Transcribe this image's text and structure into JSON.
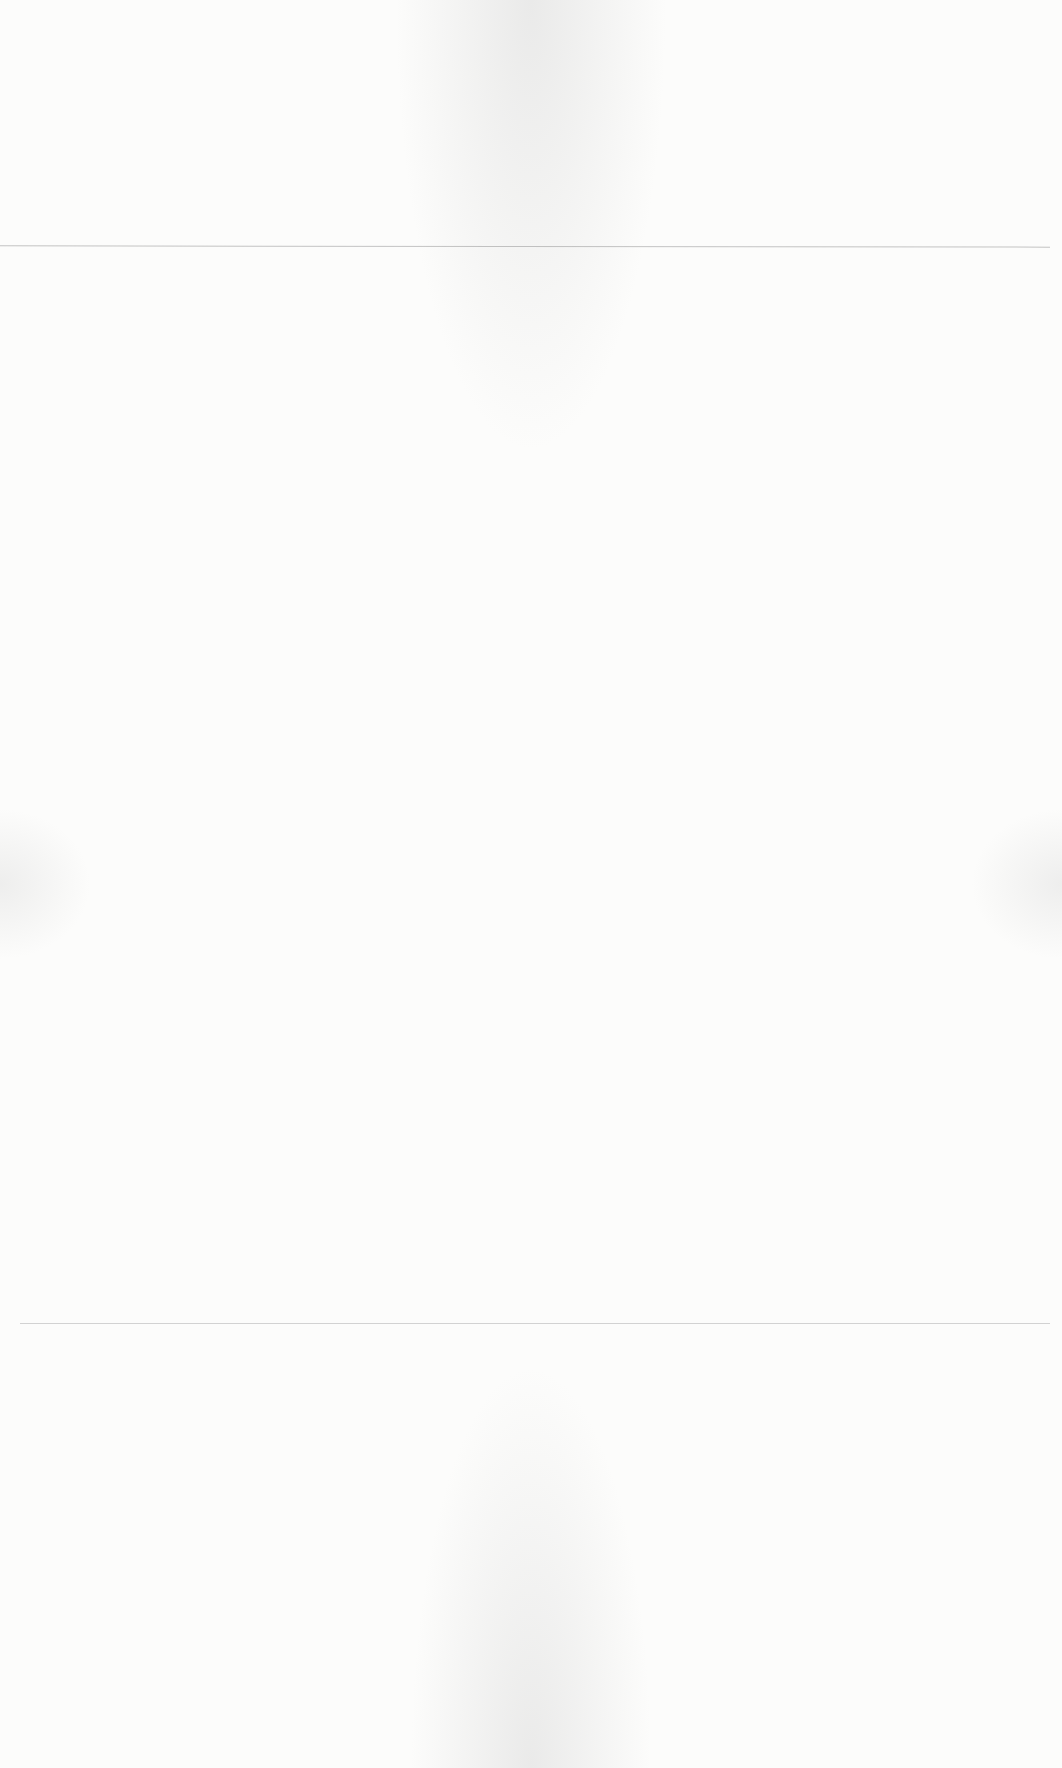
{
  "document": {
    "type": "scanned blank page",
    "visible_text": ""
  }
}
